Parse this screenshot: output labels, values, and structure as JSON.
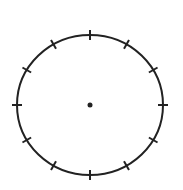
{
  "diagram": {
    "type": "circle-with-ticks",
    "center": {
      "x": 90,
      "y": 105
    },
    "radius_x": 73,
    "radius_y": 70,
    "tick_count": 12,
    "tick_length": 10,
    "stroke_color": "#222222",
    "stroke_width": 2,
    "center_dot_radius": 2.5,
    "background": "#ffffff"
  }
}
